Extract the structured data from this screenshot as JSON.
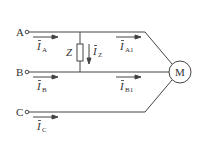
{
  "diagram": {
    "terminals": [
      {
        "id": "A",
        "label": "A"
      },
      {
        "id": "B",
        "label": "B"
      },
      {
        "id": "C",
        "label": "C"
      }
    ],
    "currents": {
      "IA": {
        "symbol": "I",
        "sub": "A"
      },
      "IB": {
        "symbol": "I",
        "sub": "B"
      },
      "IC": {
        "symbol": "I",
        "sub": "C"
      },
      "IZ": {
        "symbol": "I",
        "sub": "Z"
      },
      "IA1": {
        "symbol": "I",
        "sub": "A1"
      },
      "IB1": {
        "symbol": "I",
        "sub": "B1"
      }
    },
    "impedance": {
      "label": "Z"
    },
    "motor": {
      "label": "M"
    },
    "colors": {
      "line": "#444444",
      "text": "#333333"
    }
  }
}
